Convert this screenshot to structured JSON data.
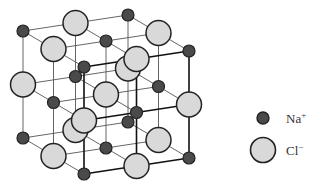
{
  "figure": {
    "lattice": {
      "size": 3,
      "origin": [
        84,
        174
      ],
      "x_step": [
        52.5,
        -8
      ],
      "depth_step": [
        -30.5,
        -18
      ],
      "up_step": [
        0,
        -53.5
      ],
      "rule": "Na when (i+j+k) even, Cl otherwise"
    },
    "colors": {
      "na_fill": "#4a4a4a",
      "cl_fill": "#d9d9d9",
      "outline": "#222222",
      "bond_back": "#555555",
      "bond_front": "#111111"
    },
    "radii": {
      "na": 6,
      "cl": 12.5
    }
  },
  "legend": {
    "items": [
      {
        "id": "na",
        "ion": "Na",
        "charge": "+",
        "label": "Na+"
      },
      {
        "id": "cl",
        "ion": "Cl",
        "charge": "−",
        "label": "Cl−"
      }
    ]
  }
}
